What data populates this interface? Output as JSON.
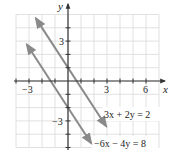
{
  "chart_data": {
    "type": "line",
    "title": "",
    "xlabel": "x",
    "ylabel": "y",
    "xlim": [
      -4,
      7
    ],
    "ylim": [
      -5,
      5
    ],
    "grid": true,
    "x_tick_labels": [
      "-3",
      "3",
      "6"
    ],
    "x_tick_values": [
      -3,
      3,
      6
    ],
    "y_tick_labels": [
      "3",
      "-3"
    ],
    "y_tick_values": [
      3,
      -3
    ],
    "series": [
      {
        "name": "3x + 2y = 2",
        "equation": "y = 1 - 1.5x",
        "x": [
          -2.46,
          2.92
        ],
        "y": [
          4.69,
          -3.38
        ],
        "arrows": "both"
      },
      {
        "name": "−6x − 4y = 8",
        "equation": "y = -2 - 1.5x",
        "x": [
          -3.15,
          1.77
        ],
        "y": [
          2.73,
          -4.66
        ],
        "arrows": "both"
      }
    ],
    "annotations": [
      {
        "text": "3x + 2y = 2",
        "x": 2.8,
        "y": -2.8
      },
      {
        "text": "−6x − 4y = 8",
        "x": 2.0,
        "y": -5.0
      }
    ]
  },
  "colors": {
    "grid": "#d9d9d9",
    "axis": "#333333",
    "line": "#8a8a8a",
    "text": "#222222"
  },
  "labels": {
    "x_axis": "x",
    "y_axis": "y",
    "x_tick_neg3": "−3",
    "x_tick_3": "3",
    "x_tick_6": "6",
    "y_tick_3": "3",
    "y_tick_neg3": "−3",
    "eq1": "3x + 2y = 2",
    "eq2": "−6x − 4y = 8"
  }
}
